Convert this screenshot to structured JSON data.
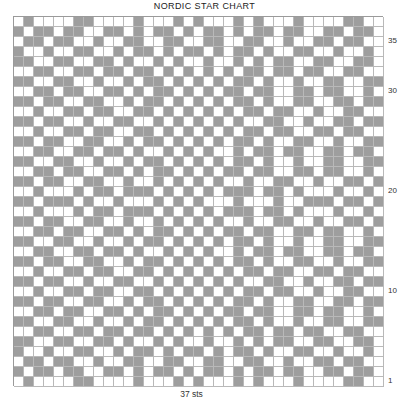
{
  "chart": {
    "title": "NORDIC STAR CHART",
    "stitch_label": "37 sts",
    "columns": 37,
    "rows": 37,
    "colors": {
      "background": "#ffffff",
      "main": "#9e9e9e",
      "gridline": "#b9b9b9",
      "border": "#9a9a9a"
    },
    "row_labels": [
      {
        "row": 35,
        "text": "35"
      },
      {
        "row": 30,
        "text": "30"
      },
      {
        "row": 20,
        "text": "20"
      },
      {
        "row": 10,
        "text": "10"
      },
      {
        "row": 1,
        "text": "1"
      }
    ],
    "legend": {
      "filled": "main colour",
      "empty": "background colour"
    },
    "grid": [
      "0100001100001000101000101000100001100",
      "1011011001101011010110101101100110110",
      "0110110010011001100110011001001101100",
      "1001001100101101011010110100110010010",
      "1100110011010010100100101011001100110",
      "0011001101101101010101011011011001100",
      "1100110010010110101010110100100110011",
      "0011011001101011010101101100110110010",
      "1101100110010110101010110100110011011",
      "0010011011001101010101011011001001100",
      "1101100100110010101010100110010011011",
      "0010011011001101010101011011001101100",
      "1101100110010110101010110100110010011",
      "0011001101101001010100101101100110110",
      "1100110010010110101010110100100110011",
      "0011011001101011010101101100110110010",
      "1101100110010010101010010011001001101",
      "0010001011011101010101110110100010010",
      "1101110100100010101000100010011101101",
      "0010001011011101010101110110100010010",
      "1101100110010010101010010011001001101",
      "0011011001101011010101101100110110010",
      "1100110010010110101010110100100110011",
      "0011001101101001010100101101100110110",
      "1101100110010110101010110100110010011",
      "0010011011001101010101011011001101100",
      "1101100100110010101010100110010011011",
      "0010011011001101010101011011001001100",
      "1101100110010110101010110100110011011",
      "0011011001101011010101101100110110010",
      "1100110010010110101010110100100110011",
      "0011001101101101010101011011011001100",
      "1100110011010010100100101011001100110",
      "1001001100101101011010110100110010010",
      "0110110010011001100110011001001101100",
      "1011011001101011010110101101100110110",
      "0100001100001000101000101000100001100"
    ]
  }
}
